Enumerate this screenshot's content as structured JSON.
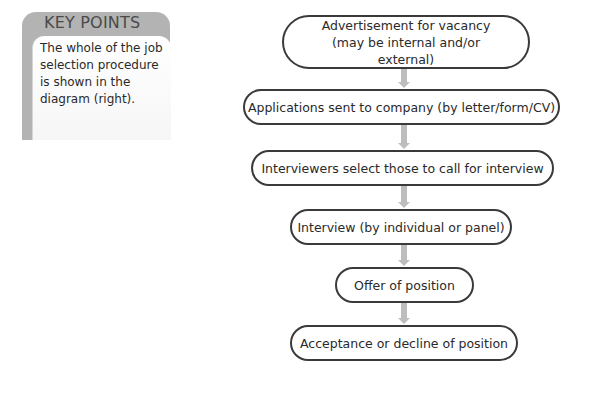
{
  "key_points": {
    "title": "KEY POINTS",
    "text": "The whole of the job selection procedure is shown in the diagram (right)."
  },
  "flowchart": {
    "nodes": [
      {
        "label": "Advertisement for vacancy (may be internal and/or external)"
      },
      {
        "label": "Applications sent to company (by letter/form/CV)"
      },
      {
        "label": "Interviewers select those to call for interview"
      },
      {
        "label": "Interview (by individual or panel)"
      },
      {
        "label": "Offer of position"
      },
      {
        "label": "Acceptance or decline of position"
      }
    ],
    "colors": {
      "border": "#3a3a3a",
      "arrow": "#bdbdbd",
      "sidebar": "#b3b3b3"
    }
  }
}
